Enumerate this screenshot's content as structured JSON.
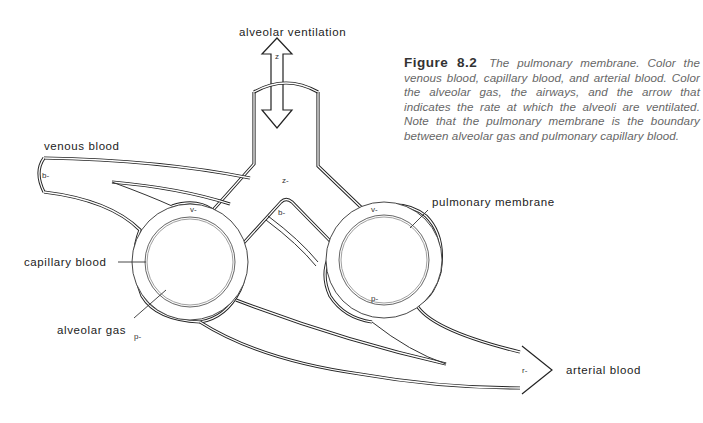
{
  "figure": {
    "number": "Figure 8.2",
    "caption": "The pulmonary membrane. Color the venous blood, capillary blood, and arterial blood. Color the alveolar gas, the airways, and the arrow that indicates the rate at which the alveoli are ventilated. Note that the pulmonary membrane is the boundary between alveolar gas and pulmonary capillary blood."
  },
  "labels": {
    "alveolar_ventilation": "alveolar ventilation",
    "venous_blood": "venous blood",
    "capillary_blood": "capillary blood",
    "alveolar_gas": "alveolar gas",
    "pulmonary_membrane": "pulmonary membrane",
    "arterial_blood": "arterial blood"
  },
  "color_tags": {
    "ventilation_arrow": "z",
    "airway": "z-",
    "venous_inlet": "b-",
    "venous_branch": "b-",
    "left_capillary": "v-",
    "right_capillary": "v-",
    "left_alveolus": "p-",
    "right_alveolus": "p-",
    "arterial_outlet": "r-"
  },
  "colors": {
    "line": "#222222",
    "caption_text": "#666666",
    "background": "#ffffff"
  }
}
